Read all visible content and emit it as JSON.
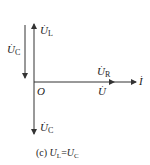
{
  "diagram": {
    "type": "phasor-diagram",
    "origin_label": "O",
    "phasors": [
      {
        "name": "U_L",
        "symbol": "U",
        "subscript": "L",
        "direction": "up"
      },
      {
        "name": "U_C_left",
        "symbol": "U",
        "subscript": "C",
        "direction": "down"
      },
      {
        "name": "U_C",
        "symbol": "U",
        "subscript": "C",
        "direction": "down"
      },
      {
        "name": "U_R",
        "symbol": "U",
        "subscript": "R",
        "direction": "right"
      },
      {
        "name": "U",
        "symbol": "U",
        "subscript": "",
        "direction": "right"
      },
      {
        "name": "I",
        "symbol": "I",
        "subscript": "",
        "direction": "right"
      }
    ],
    "colors": {
      "line": "#333333",
      "text": "#222222",
      "background": "#ffffff"
    }
  },
  "caption": {
    "prefix": "(c)",
    "var1": "U",
    "sub1": "L",
    "eq": "=",
    "var2": "U",
    "sub2": "C"
  }
}
